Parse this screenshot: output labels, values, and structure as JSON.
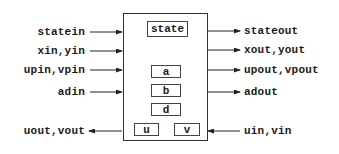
{
  "diagram": {
    "main_block": {
      "sub_blocks": [
        {
          "id": "state",
          "label": "state"
        },
        {
          "id": "a",
          "label": "a"
        },
        {
          "id": "b",
          "label": "b"
        },
        {
          "id": "d",
          "label": "d"
        },
        {
          "id": "u",
          "label": "u"
        },
        {
          "id": "v",
          "label": "v"
        }
      ]
    },
    "left_ports": [
      {
        "label": "statein",
        "direction": "in"
      },
      {
        "label": "xin,yin",
        "direction": "in"
      },
      {
        "label": "upin,vpin",
        "direction": "in"
      },
      {
        "label": "adin",
        "direction": "in"
      },
      {
        "label": "uout,vout",
        "direction": "out"
      }
    ],
    "right_ports": [
      {
        "label": "stateout",
        "direction": "out"
      },
      {
        "label": "xout,yout",
        "direction": "out"
      },
      {
        "label": "upout,vpout",
        "direction": "out"
      },
      {
        "label": "adout",
        "direction": "out"
      },
      {
        "label": "uin,vin",
        "direction": "in"
      }
    ]
  }
}
